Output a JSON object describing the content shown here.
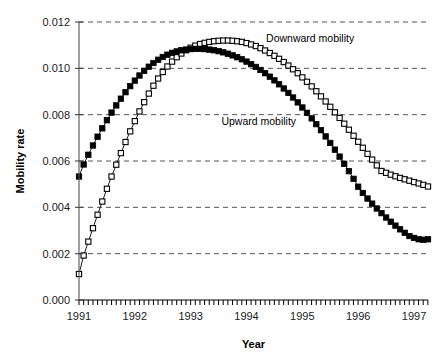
{
  "chart_data": {
    "type": "line",
    "title": "",
    "xlabel": "Year",
    "ylabel": "Mobility rate",
    "xlim": [
      1991.0,
      1997.25
    ],
    "ylim": [
      0.0,
      0.012
    ],
    "grid": true,
    "legend_position": "inline-annotation",
    "x_tick_labels": [
      "1991",
      "1992",
      "1993",
      "1994",
      "1995",
      "1996",
      "1997"
    ],
    "x_ticks": [
      1991,
      1992,
      1993,
      1994,
      1995,
      1996,
      1997
    ],
    "y_tick_labels": [
      "0.000",
      "0.002",
      "0.004",
      "0.006",
      "0.008",
      "0.010",
      "0.012"
    ],
    "y_ticks": [
      0.0,
      0.002,
      0.004,
      0.006,
      0.008,
      0.01,
      0.012
    ],
    "x_minor_tick_interval": 0.0833,
    "annotations": [
      {
        "text": "Downward mobility",
        "x": 1994.35,
        "y": 0.01115,
        "marker": "open-square"
      },
      {
        "text": "Upward mobility",
        "x": 1993.55,
        "y": 0.00755,
        "marker": "filled-square"
      }
    ],
    "series": [
      {
        "name": "Downward mobility",
        "marker": "open-square",
        "color": "#000000",
        "fill": "#ffffff",
        "x": [
          1991.0,
          1991.083,
          1991.167,
          1991.25,
          1991.333,
          1991.417,
          1991.5,
          1991.583,
          1991.667,
          1991.75,
          1991.833,
          1991.917,
          1992.0,
          1992.083,
          1992.167,
          1992.25,
          1992.333,
          1992.417,
          1992.5,
          1992.583,
          1992.667,
          1992.75,
          1992.833,
          1992.917,
          1993.0,
          1993.083,
          1993.167,
          1993.25,
          1993.333,
          1993.417,
          1993.5,
          1993.583,
          1993.667,
          1993.75,
          1993.833,
          1993.917,
          1994.0,
          1994.083,
          1994.167,
          1994.25,
          1994.333,
          1994.417,
          1994.5,
          1994.583,
          1994.667,
          1994.75,
          1994.833,
          1994.917,
          1995.0,
          1995.083,
          1995.167,
          1995.25,
          1995.333,
          1995.417,
          1995.5,
          1995.583,
          1995.667,
          1995.75,
          1995.833,
          1995.917,
          1996.0,
          1996.083,
          1996.167,
          1996.25,
          1996.333,
          1996.417,
          1996.5,
          1996.583,
          1996.667,
          1996.75,
          1996.833,
          1996.917,
          1997.0,
          1997.083,
          1997.167,
          1997.25
        ],
        "y": [
          0.00112,
          0.00192,
          0.00252,
          0.0031,
          0.00368,
          0.00425,
          0.0048,
          0.00533,
          0.00584,
          0.00634,
          0.00682,
          0.00728,
          0.00772,
          0.00814,
          0.00854,
          0.00891,
          0.00925,
          0.00956,
          0.00984,
          0.01008,
          0.01029,
          0.01048,
          0.01064,
          0.01078,
          0.01089,
          0.01098,
          0.01105,
          0.0111,
          0.01114,
          0.01117,
          0.01119,
          0.0112,
          0.0112,
          0.01119,
          0.01117,
          0.01114,
          0.01109,
          0.01103,
          0.01096,
          0.01087,
          0.01077,
          0.01066,
          0.01054,
          0.01041,
          0.01027,
          0.01012,
          0.00996,
          0.00979,
          0.00961,
          0.00942,
          0.00922,
          0.00901,
          0.00879,
          0.00857,
          0.00834,
          0.0081,
          0.00786,
          0.00761,
          0.00735,
          0.00709,
          0.00683,
          0.00657,
          0.00631,
          0.00606,
          0.00581,
          0.00557,
          0.00549,
          0.00541,
          0.00534,
          0.00527,
          0.00521,
          0.00515,
          0.00509,
          0.00503,
          0.00497,
          0.0049
        ]
      },
      {
        "name": "Upward mobility",
        "marker": "filled-square",
        "color": "#000000",
        "fill": "#000000",
        "x": [
          1991.0,
          1991.083,
          1991.167,
          1991.25,
          1991.333,
          1991.417,
          1991.5,
          1991.583,
          1991.667,
          1991.75,
          1991.833,
          1991.917,
          1992.0,
          1992.083,
          1992.167,
          1992.25,
          1992.333,
          1992.417,
          1992.5,
          1992.583,
          1992.667,
          1992.75,
          1992.833,
          1992.917,
          1993.0,
          1993.083,
          1993.167,
          1993.25,
          1993.333,
          1993.417,
          1993.5,
          1993.583,
          1993.667,
          1993.75,
          1993.833,
          1993.917,
          1994.0,
          1994.083,
          1994.167,
          1994.25,
          1994.333,
          1994.417,
          1994.5,
          1994.583,
          1994.667,
          1994.75,
          1994.833,
          1994.917,
          1995.0,
          1995.083,
          1995.167,
          1995.25,
          1995.333,
          1995.417,
          1995.5,
          1995.583,
          1995.667,
          1995.75,
          1995.833,
          1995.917,
          1996.0,
          1996.083,
          1996.167,
          1996.25,
          1996.333,
          1996.417,
          1996.5,
          1996.583,
          1996.667,
          1996.75,
          1996.833,
          1996.917,
          1997.0,
          1997.083,
          1997.167,
          1997.25
        ],
        "y": [
          0.00533,
          0.00585,
          0.00627,
          0.00667,
          0.00705,
          0.00741,
          0.00776,
          0.00809,
          0.0084,
          0.00869,
          0.00897,
          0.00923,
          0.00947,
          0.00969,
          0.00989,
          0.01007,
          0.01023,
          0.01037,
          0.01049,
          0.01059,
          0.01067,
          0.01073,
          0.01078,
          0.01081,
          0.01083,
          0.01084,
          0.01084,
          0.01083,
          0.01081,
          0.01078,
          0.01074,
          0.01069,
          0.01063,
          0.01056,
          0.01048,
          0.01039,
          0.01029,
          0.01018,
          0.01006,
          0.00993,
          0.00979,
          0.00964,
          0.00948,
          0.00931,
          0.00913,
          0.00894,
          0.00874,
          0.00853,
          0.00831,
          0.00808,
          0.00784,
          0.00759,
          0.00733,
          0.00706,
          0.00678,
          0.00649,
          0.00619,
          0.00588,
          0.00556,
          0.00523,
          0.00489,
          0.00462,
          0.00438,
          0.00416,
          0.00395,
          0.00375,
          0.00356,
          0.00338,
          0.00321,
          0.00305,
          0.0029,
          0.00276,
          0.00268,
          0.00262,
          0.0026,
          0.00262
        ]
      }
    ]
  }
}
